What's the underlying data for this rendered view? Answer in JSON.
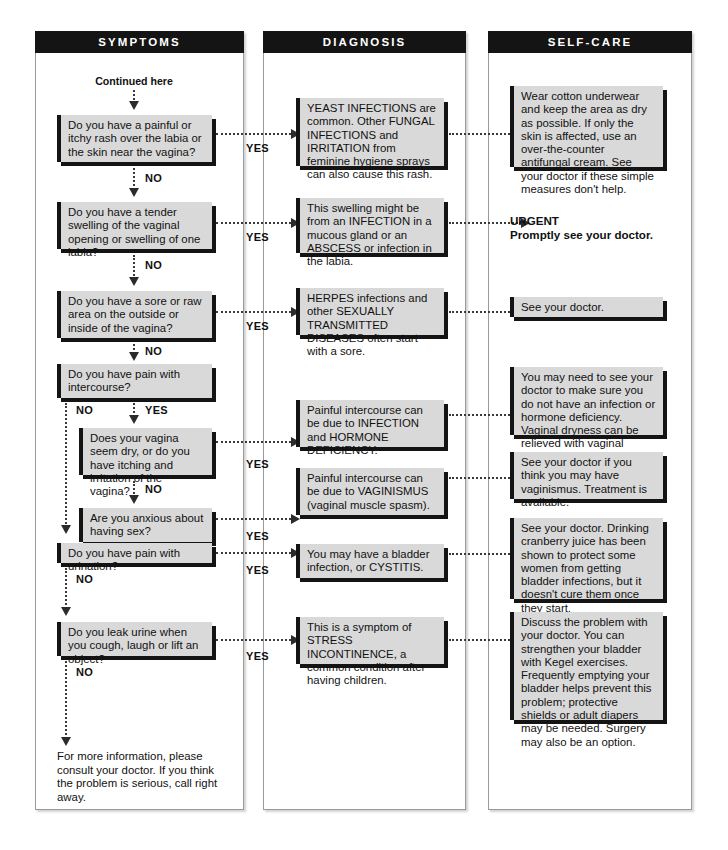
{
  "document": {
    "title": "Vaginal / Urinary Symptoms Self-Care Flowchart",
    "entry_label": "Continued here",
    "footer_note": "For more information, please consult your doctor. If you think the problem is serious, call right away.",
    "yes_label": "YES",
    "no_label": "NO",
    "colors": {
      "header_bg": "#141414",
      "header_text": "#ffffff",
      "box_fill": "#d9d9d9",
      "box_accent": "#141414",
      "connector": "#3a3a3a",
      "page_bg": "#ffffff"
    }
  },
  "columns": [
    {
      "id": "symptoms",
      "title": "SYMPTOMS"
    },
    {
      "id": "diagnosis",
      "title": "DIAGNOSIS"
    },
    {
      "id": "selfcare",
      "title": "SELF-CARE"
    }
  ],
  "symptoms": [
    {
      "id": "s1",
      "text": "Do you have a painful or itchy rash over the labia or the skin near the vagina?"
    },
    {
      "id": "s2",
      "text": "Do you have a tender swelling of the vaginal opening or swelling of one labia?"
    },
    {
      "id": "s3",
      "text": "Do you have a sore or raw area on the outside or inside of the vagina?"
    },
    {
      "id": "s4",
      "text": "Do you have pain with intercourse?"
    },
    {
      "id": "s5",
      "text": "Does your vagina seem dry, or do you have itching and irritation of the vagina?"
    },
    {
      "id": "s6",
      "text": "Are you anxious about having sex?"
    },
    {
      "id": "s7",
      "text": "Do you have pain with urination?"
    },
    {
      "id": "s8",
      "text": "Do you leak urine when you cough, laugh or lift an object?"
    }
  ],
  "diagnoses": [
    {
      "id": "d1",
      "text": "YEAST INFECTIONS are common. Other FUNGAL INFECTIONS and IRRITATION from feminine hygiene sprays can also cause this rash."
    },
    {
      "id": "d2",
      "text": "This swelling might be from an INFECTION in a mucous gland or an ABSCESS or infection in the labia."
    },
    {
      "id": "d3",
      "text": "HERPES infections and other SEXUALLY TRANSMITTED DISEASES often start with a sore."
    },
    {
      "id": "d5",
      "text": "Painful intercourse can be due to INFECTION and HORMONE DEFICIENCY."
    },
    {
      "id": "d6",
      "text": "Painful intercourse can be due to VAGINISMUS (vaginal muscle spasm)."
    },
    {
      "id": "d7",
      "text": "You may have a bladder infection, or CYSTITIS."
    },
    {
      "id": "d8",
      "text": "This is a symptom of STRESS INCONTINENCE, a common condition after having children."
    }
  ],
  "selfcare": [
    {
      "id": "c1",
      "type": "box",
      "text": "Wear cotton underwear and keep the area as dry as possible. If only the skin is affected, use an over-the-counter antifungal cream. See your doctor if these simple measures don't help."
    },
    {
      "id": "c2",
      "type": "urgent",
      "line1": "URGENT",
      "line2": "Promptly see your doctor."
    },
    {
      "id": "c3",
      "type": "box",
      "text": "See your doctor."
    },
    {
      "id": "c5",
      "type": "box",
      "text": "You may need to see your doctor to make sure you do not  have an infection or hormone deficiency. Vaginal dryness can be relieved with vaginal lubricants."
    },
    {
      "id": "c6",
      "type": "box",
      "text": "See your doctor if you think you may have vaginismus. Treatment is available."
    },
    {
      "id": "c7",
      "type": "box",
      "text": "See your doctor. Drinking cranberry juice has been shown to protect some women from getting bladder infections, but it doesn't cure them once they start."
    },
    {
      "id": "c8",
      "type": "box",
      "text": "Discuss the problem with your doctor. You can strengthen your bladder with Kegel exercises. Frequently emptying your bladder helps prevent this problem; protective shields or adult diapers may be needed. Surgery may also be an option."
    }
  ]
}
